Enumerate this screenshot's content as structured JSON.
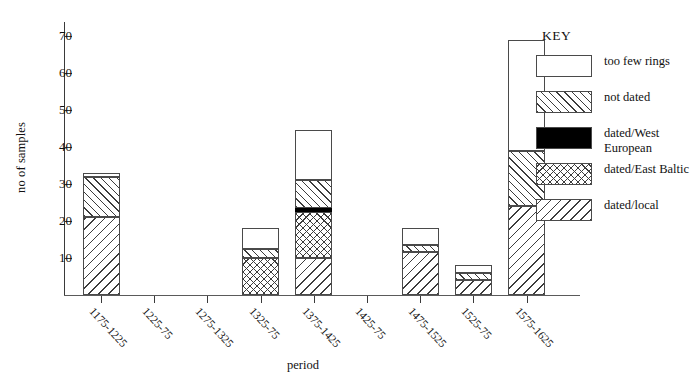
{
  "chart_data": {
    "type": "bar",
    "stacked": true,
    "title": "",
    "xlabel": "period",
    "ylabel": "no of samples",
    "ylim": [
      0,
      73
    ],
    "yticks": [
      10,
      20,
      30,
      40,
      50,
      60,
      70
    ],
    "grid": false,
    "legend_position": "right",
    "legend_title": "KEY",
    "categories": [
      "1175-1225",
      "1225-75",
      "1275-1325",
      "1325-75",
      "1375-1425",
      "1425-75",
      "1475-1525",
      "1525-75",
      "1575-1625"
    ],
    "series": [
      {
        "name": "dated/local",
        "values": [
          21,
          0,
          0,
          0,
          10,
          0,
          11.5,
          4,
          24
        ]
      },
      {
        "name": "dated/East Baltic",
        "values": [
          0,
          0,
          0,
          10,
          12.5,
          0,
          0,
          0,
          0
        ]
      },
      {
        "name": "dated/West European",
        "values": [
          0,
          0,
          0,
          0,
          1,
          0,
          0,
          0,
          0
        ]
      },
      {
        "name": "not dated",
        "values": [
          11,
          0,
          0,
          2.5,
          7.5,
          0,
          2,
          2,
          15
        ]
      },
      {
        "name": "too few rings",
        "values": [
          1,
          0,
          0,
          5.5,
          13.5,
          0,
          4.5,
          2,
          30
        ]
      }
    ],
    "totals": [
      33,
      0,
      0,
      18,
      44.5,
      0,
      18,
      8,
      69
    ]
  },
  "legend": {
    "title": "KEY",
    "items": [
      {
        "label": "too few rings",
        "pattern": "blank"
      },
      {
        "label": "not dated",
        "pattern": "diagonal-up-hatch"
      },
      {
        "label": "dated/West European",
        "pattern": "solid-black"
      },
      {
        "label": "dated/East Baltic",
        "pattern": "cross-hatch"
      },
      {
        "label": "dated/local",
        "pattern": "diagonal-down-hatch"
      }
    ]
  },
  "axes": {
    "y_label": "no of samples",
    "x_label": "period",
    "y_tick_labels": [
      "10",
      "20",
      "30",
      "40",
      "50",
      "60",
      "70"
    ]
  }
}
